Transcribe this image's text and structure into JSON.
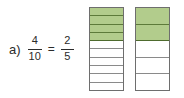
{
  "item": {
    "label": "a)"
  },
  "equation": {
    "left_fraction": {
      "numerator": "4",
      "denominator": "10"
    },
    "operator": "=",
    "right_fraction": {
      "numerator": "2",
      "denominator": "5"
    }
  },
  "colors": {
    "fill_green": "#b2cc8c",
    "fill_green_border": "#5d7a3a",
    "bar_outline": "#6e6e6e",
    "cell_divider": "#8a8a8a",
    "text": "#2b2b2b",
    "background": "#ffffff"
  },
  "bar_models": [
    {
      "name": "ten-part-bar",
      "total_parts": 10,
      "shaded_parts": 4,
      "orientation": "vertical",
      "shade_from": "top",
      "cells": [
        {
          "index": 1,
          "shaded": true
        },
        {
          "index": 2,
          "shaded": true
        },
        {
          "index": 3,
          "shaded": true
        },
        {
          "index": 4,
          "shaded": true
        },
        {
          "index": 5,
          "shaded": false
        },
        {
          "index": 6,
          "shaded": false
        },
        {
          "index": 7,
          "shaded": false
        },
        {
          "index": 8,
          "shaded": false
        },
        {
          "index": 9,
          "shaded": false
        },
        {
          "index": 10,
          "shaded": false
        }
      ]
    },
    {
      "name": "five-part-bar",
      "total_parts": 5,
      "shaded_parts": 2,
      "orientation": "vertical",
      "shade_from": "top",
      "cells": [
        {
          "index": 1,
          "shaded": true
        },
        {
          "index": 2,
          "shaded": true
        },
        {
          "index": 3,
          "shaded": false
        },
        {
          "index": 4,
          "shaded": false
        },
        {
          "index": 5,
          "shaded": false
        }
      ]
    }
  ]
}
